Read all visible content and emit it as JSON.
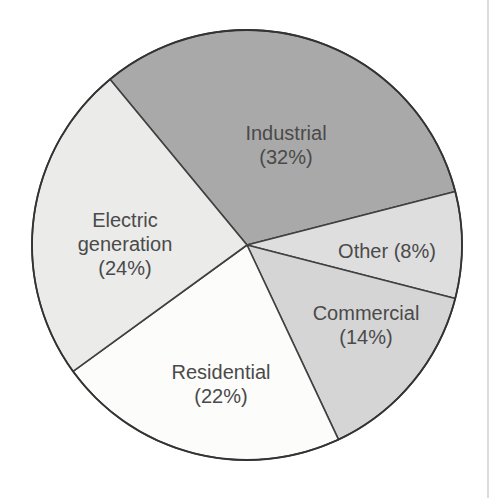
{
  "figure": {
    "background": "#ffffff",
    "text_color": "#4a4a4a",
    "page_edge_artifact": {
      "x": 487,
      "color": "#dbdbd9",
      "width": 2
    }
  },
  "chart_data": {
    "type": "pie",
    "title": "",
    "categories": [
      "Industrial",
      "Other",
      "Commercial",
      "Residential",
      "Electric generation"
    ],
    "values": [
      32,
      8,
      14,
      22,
      24
    ],
    "unit": "%",
    "legend_position": "none",
    "labels_position": "inside",
    "layout": {
      "cx": 247,
      "cy": 245,
      "r": 215,
      "start_angle_deg": 129.6,
      "direction": "clockwise",
      "slice_stroke": "#404040",
      "slice_stroke_width": 1.6,
      "outline_stroke": "#333333",
      "outline_stroke_width": 1.8,
      "label_font_size": 20,
      "label_line_height": 24
    },
    "slices": [
      {
        "label": "Industrial",
        "value": 32,
        "color": "#a9a9a9",
        "label_lines": [
          "Industrial",
          "(32%)"
        ],
        "label_x": 286,
        "label_y": 140
      },
      {
        "label": "Other",
        "value": 8,
        "color": "#dedede",
        "label_lines": [
          "Other (8%)"
        ],
        "label_x": 387,
        "label_y": 258
      },
      {
        "label": "Commercial",
        "value": 14,
        "color": "#d5d5d5",
        "label_lines": [
          "Commercial",
          "(14%)"
        ],
        "label_x": 366,
        "label_y": 320
      },
      {
        "label": "Residential",
        "value": 22,
        "color": "#fcfcfa",
        "label_lines": [
          "Residential",
          "(22%)"
        ],
        "label_x": 221,
        "label_y": 379
      },
      {
        "label": "Electric generation",
        "value": 24,
        "color": "#ebebe9",
        "label_lines": [
          "Electric",
          "generation",
          "(24%)"
        ],
        "label_x": 125,
        "label_y": 227
      }
    ]
  }
}
